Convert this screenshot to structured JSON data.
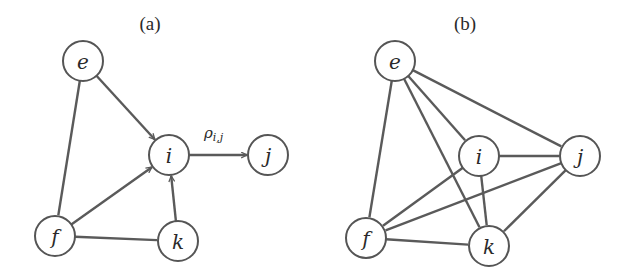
{
  "panels": [
    {
      "title": "(a)",
      "title_pos": [
        150,
        30
      ],
      "directed": true,
      "nodes": [
        {
          "id": "e",
          "label": "e",
          "x": 83,
          "y": 61
        },
        {
          "id": "i",
          "label": "i",
          "x": 169,
          "y": 155
        },
        {
          "id": "j",
          "label": "j",
          "x": 268,
          "y": 155
        },
        {
          "id": "f",
          "label": "f",
          "x": 55,
          "y": 236
        },
        {
          "id": "k",
          "label": "k",
          "x": 178,
          "y": 241
        }
      ],
      "edges": [
        {
          "from": "e",
          "to": "i",
          "arrow": true
        },
        {
          "from": "f",
          "to": "i",
          "arrow": true
        },
        {
          "from": "k",
          "to": "i",
          "arrow": true
        },
        {
          "from": "i",
          "to": "j",
          "arrow": true,
          "label": "ρi,j"
        },
        {
          "from": "e",
          "to": "f",
          "arrow": false
        },
        {
          "from": "f",
          "to": "k",
          "arrow": false
        }
      ],
      "edge_label": {
        "text": "ρ",
        "sub": "i,j",
        "x": 204,
        "y": 138
      }
    },
    {
      "title": "(b)",
      "title_pos": [
        465,
        30
      ],
      "directed": false,
      "nodes": [
        {
          "id": "e",
          "label": "e",
          "x": 395,
          "y": 61
        },
        {
          "id": "i",
          "label": "i",
          "x": 479,
          "y": 156
        },
        {
          "id": "j",
          "label": "j",
          "x": 580,
          "y": 156
        },
        {
          "id": "f",
          "label": "f",
          "x": 366,
          "y": 238
        },
        {
          "id": "k",
          "label": "k",
          "x": 489,
          "y": 246
        }
      ],
      "edges": [
        {
          "from": "e",
          "to": "f"
        },
        {
          "from": "e",
          "to": "i"
        },
        {
          "from": "e",
          "to": "k"
        },
        {
          "from": "e",
          "to": "j"
        },
        {
          "from": "i",
          "to": "j"
        },
        {
          "from": "i",
          "to": "f"
        },
        {
          "from": "i",
          "to": "k"
        },
        {
          "from": "j",
          "to": "f"
        },
        {
          "from": "j",
          "to": "k"
        },
        {
          "from": "f",
          "to": "k"
        }
      ]
    }
  ],
  "node_radius": 20,
  "colors": {
    "stroke": "#555555",
    "text": "#2a2a2a",
    "background": "#ffffff"
  }
}
